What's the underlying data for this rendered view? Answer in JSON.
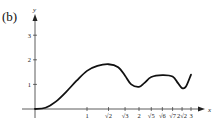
{
  "panel_label": "(b)",
  "chart_data": {
    "type": "line",
    "title": "",
    "xlabel": "x",
    "ylabel": "y",
    "xlim": [
      0,
      3
    ],
    "ylim": [
      0,
      3.5
    ],
    "grid": false,
    "x_ticks": [
      {
        "value": 1,
        "label": "1"
      },
      {
        "value": 1.414,
        "label": "√2"
      },
      {
        "value": 1.732,
        "label": "√3"
      },
      {
        "value": 2,
        "label": "2"
      },
      {
        "value": 2.236,
        "label": "√5"
      },
      {
        "value": 2.449,
        "label": "√6"
      },
      {
        "value": 2.646,
        "label": "√7"
      },
      {
        "value": 2.828,
        "label": "2√2"
      },
      {
        "value": 3,
        "label": "3"
      }
    ],
    "y_ticks": [
      {
        "value": 1,
        "label": "1"
      },
      {
        "value": 2,
        "label": "2"
      },
      {
        "value": 3,
        "label": "3"
      }
    ],
    "x": [
      0,
      0.2,
      0.4,
      0.6,
      0.8,
      1.0,
      1.2,
      1.414,
      1.6,
      1.732,
      1.85,
      2.0,
      2.1,
      2.236,
      2.449,
      2.646,
      2.75,
      2.828,
      2.9,
      3.0
    ],
    "y": [
      0,
      0.05,
      0.3,
      0.7,
      1.15,
      1.55,
      1.75,
      1.82,
      1.7,
      1.35,
      1.0,
      0.9,
      1.05,
      1.3,
      1.38,
      1.32,
      1.05,
      0.85,
      0.9,
      1.4
    ],
    "color": "#111111"
  }
}
